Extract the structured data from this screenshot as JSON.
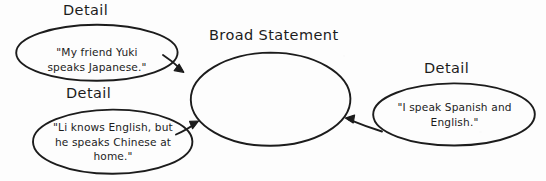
{
  "diagram": {
    "type": "concept-map",
    "background_color": "#fdfdfd",
    "stroke_color": "#1c1c1c",
    "center": {
      "heading": "Broad Statement",
      "body": ""
    },
    "details": [
      {
        "heading": "Detail",
        "lines": [
          "\"My friend Yuki",
          "speaks Japanese.\""
        ],
        "text": "\"My friend Yuki speaks Japanese.\"",
        "position": "top-left"
      },
      {
        "heading": "Detail",
        "lines": [
          "\"Li knows English, but",
          "he speaks Chinese at",
          "home.\""
        ],
        "text": "\"Li knows English, but he speaks Chinese at home.\"",
        "position": "bottom-left"
      },
      {
        "heading": "Detail",
        "lines": [
          "\"I speak Spanish and",
          "English.\""
        ],
        "text": "\"I speak Spanish and English.\"",
        "position": "right"
      }
    ],
    "connectors": [
      {
        "name": "arrow-top-left-to-center",
        "from": "top-left-detail",
        "to": "broad-statement"
      },
      {
        "name": "arrow-bottom-left-to-center",
        "from": "bottom-left-detail",
        "to": "broad-statement"
      },
      {
        "name": "arrow-right-to-center",
        "from": "right-detail",
        "to": "broad-statement"
      }
    ]
  }
}
